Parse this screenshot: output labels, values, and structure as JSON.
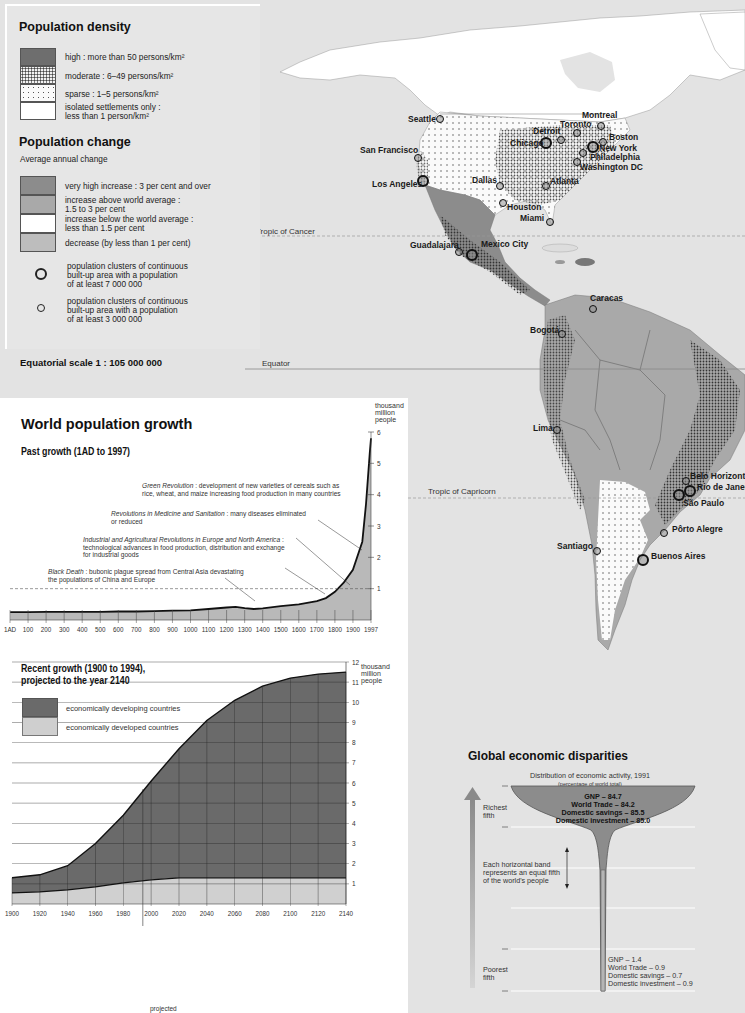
{
  "legend": {
    "density_title": "Population density",
    "density_items": [
      {
        "label_line1": "high : more than 50 persons/km²",
        "label_line2": "",
        "pattern": "dark-solid",
        "color": "#6e6e6e"
      },
      {
        "label_line1": "moderate : 6–49 persons/km²",
        "label_line2": "",
        "pattern": "dense-dots"
      },
      {
        "label_line1": "sparse : 1–5 persons/km²",
        "label_line2": "",
        "pattern": "sparse-dots"
      },
      {
        "label_line1": "isolated settlements only :",
        "label_line2": "less than 1 person/km²",
        "pattern": "white",
        "color": "#ffffff"
      }
    ],
    "change_title": "Population change",
    "change_subtitle": "Average annual change",
    "change_items": [
      {
        "label_line1": "very high increase : 3 per cent and over",
        "label_line2": "",
        "color": "#8c8c8c"
      },
      {
        "label_line1": "increase above world average :",
        "label_line2": "1.5 to 3 per cent",
        "color": "#a9a9a9"
      },
      {
        "label_line1": "increase below the world average :",
        "label_line2": "less than 1.5 per cent",
        "color": "#ffffff"
      },
      {
        "label_line1": "decrease (by less than 1 per cent)",
        "label_line2": "",
        "color": "#bdbdbd"
      }
    ],
    "cluster_items": [
      {
        "symbol": "large-circle",
        "line1": "population clusters of continuous",
        "line2": "built-up area with a population",
        "line3": "of at least 7 000 000"
      },
      {
        "symbol": "small-circle",
        "line1": "population clusters of continuous",
        "line2": "built-up area with a population",
        "line3": "of at least 3 000 000"
      }
    ],
    "scale": "Equatorial scale 1 : 105 000 000"
  },
  "map": {
    "lines": {
      "tropic_cancer": "Tropic of Cancer",
      "equator": "Equator",
      "tropic_capricorn": "Tropic of Capricorn"
    },
    "cities": [
      {
        "name": "Seattle",
        "x": 440,
        "y": 119,
        "size": "small",
        "lx": 408,
        "ly": 119
      },
      {
        "name": "San Francisco",
        "x": 418,
        "y": 158,
        "size": "small",
        "lx": 360,
        "ly": 150
      },
      {
        "name": "Los Angeles",
        "x": 423,
        "y": 181,
        "size": "large",
        "lx": 372,
        "ly": 184
      },
      {
        "name": "Montreal",
        "x": 601,
        "y": 126,
        "size": "small",
        "lx": 582,
        "ly": 115
      },
      {
        "name": "Toronto",
        "x": 577,
        "y": 133,
        "size": "small",
        "lx": 560,
        "ly": 124
      },
      {
        "name": "Detroit",
        "x": 561,
        "y": 140,
        "size": "small",
        "lx": 533,
        "ly": 131
      },
      {
        "name": "Chicago",
        "x": 546,
        "y": 143,
        "size": "large",
        "lx": 510,
        "ly": 143
      },
      {
        "name": "Boston",
        "x": 603,
        "y": 142,
        "size": "small",
        "lx": 609,
        "ly": 137
      },
      {
        "name": "New York",
        "x": 593,
        "y": 147,
        "size": "large",
        "lx": 599,
        "ly": 148
      },
      {
        "name": "Philadelphia",
        "x": 583,
        "y": 153,
        "size": "small",
        "lx": 590,
        "ly": 157
      },
      {
        "name": "Washington DC",
        "x": 577,
        "y": 162,
        "size": "small",
        "lx": 580,
        "ly": 167
      },
      {
        "name": "Dallas",
        "x": 500,
        "y": 186,
        "size": "small",
        "lx": 472,
        "ly": 180
      },
      {
        "name": "Atlanta",
        "x": 546,
        "y": 186,
        "size": "small",
        "lx": 550,
        "ly": 181
      },
      {
        "name": "Houston",
        "x": 503,
        "y": 203,
        "size": "small",
        "lx": 507,
        "ly": 207
      },
      {
        "name": "Miami",
        "x": 550,
        "y": 222,
        "size": "small",
        "lx": 520,
        "ly": 218
      },
      {
        "name": "Guadalajara",
        "x": 459,
        "y": 252,
        "size": "small",
        "lx": 410,
        "ly": 245
      },
      {
        "name": "Mexico City",
        "x": 472,
        "y": 255,
        "size": "large",
        "lx": 481,
        "ly": 244
      },
      {
        "name": "Caracas",
        "x": 593,
        "y": 309,
        "size": "small",
        "lx": 590,
        "ly": 298
      },
      {
        "name": "Bogotá",
        "x": 562,
        "y": 334,
        "size": "small",
        "lx": 530,
        "ly": 330
      },
      {
        "name": "Lima",
        "x": 557,
        "y": 430,
        "size": "small",
        "lx": 533,
        "ly": 428
      },
      {
        "name": "Belo Horizonte",
        "x": 686,
        "y": 481,
        "size": "small",
        "lx": 690,
        "ly": 476
      },
      {
        "name": "Rio de Janeiro",
        "x": 690,
        "y": 491,
        "size": "large",
        "lx": 697,
        "ly": 487
      },
      {
        "name": "São Paulo",
        "x": 679,
        "y": 495,
        "size": "large",
        "lx": 683,
        "ly": 503
      },
      {
        "name": "Pôrto Alegre",
        "x": 664,
        "y": 533,
        "size": "small",
        "lx": 672,
        "ly": 529
      },
      {
        "name": "Santiago",
        "x": 597,
        "y": 551,
        "size": "small",
        "lx": 557,
        "ly": 546
      },
      {
        "name": "Buenos Aires",
        "x": 643,
        "y": 560,
        "size": "large",
        "lx": 651,
        "ly": 556
      }
    ]
  },
  "growth": {
    "title": "World population growth",
    "past": {
      "subtitle": "Past growth (1AD to 1997)",
      "yunit_1": "thousand",
      "yunit_2": "million",
      "yunit_3": "people",
      "annotations": [
        {
          "italic": "Green Revolution",
          "text": " : development of new varieties of cereals such as",
          "line2": "rice, wheat, and maize increasing food production in many countries"
        },
        {
          "italic": "Revolutions in Medicine and Sanitation",
          "text": " : many diseases eliminated",
          "line2": "or reduced"
        },
        {
          "italic": "Industrial and Agricultural Revolutions in Europe and North America",
          "text": " :",
          "line2": "technological advances in food production, distribution and exchange",
          "line3": "for industrial goods"
        },
        {
          "italic": "Black Death",
          "text": " : bubonic plague spread from Central Asia devastating",
          "line2": "the populations of China and Europe"
        }
      ]
    },
    "recent": {
      "subtitle_1": "Recent growth (1900 to 1994),",
      "subtitle_2": "projected to the year 2140",
      "legend": [
        "economically developing countries",
        "economically developed countries"
      ],
      "yunit_1": "thousand",
      "yunit_2": "million",
      "yunit_3": "people",
      "projected_label": "projected"
    }
  },
  "econ": {
    "title": "Global economic disparities",
    "subtitle": "Distribution of economic activity, 1991",
    "subtitle_note": "(percentage of world total)",
    "richest_label_1": "Richest",
    "richest_label_2": "fifth",
    "poorest_label_1": "Poorest",
    "poorest_label_2": "fifth",
    "band_note_1": "Each horizontal band",
    "band_note_2": "represents an equal fifth",
    "band_note_3": "of the world's people",
    "richest_values": [
      "GNP – 84.7",
      "World Trade – 84.2",
      "Domestic savings – 85.5",
      "Domestic investment – 85.0"
    ],
    "poorest_values": [
      "GNP – 1.4",
      "World Trade – 0.9",
      "Domestic savings – 0.7",
      "Domestic investment – 0.9"
    ]
  },
  "chart_data": [
    {
      "type": "area",
      "title": "Past growth (1AD to 1997)",
      "xlabel": "",
      "ylabel": "thousand million people",
      "x": [
        1,
        100,
        200,
        300,
        400,
        500,
        600,
        700,
        800,
        900,
        1000,
        1100,
        1200,
        1250,
        1300,
        1350,
        1400,
        1500,
        1600,
        1700,
        1750,
        1800,
        1850,
        1900,
        1950,
        1970,
        1990,
        1997
      ],
      "values": [
        0.25,
        0.25,
        0.26,
        0.26,
        0.26,
        0.26,
        0.27,
        0.27,
        0.28,
        0.3,
        0.31,
        0.35,
        0.4,
        0.42,
        0.38,
        0.35,
        0.37,
        0.44,
        0.5,
        0.6,
        0.7,
        0.9,
        1.2,
        1.6,
        2.5,
        3.7,
        5.3,
        5.8
      ],
      "xticks": [
        "1AD",
        "100",
        "200",
        "300",
        "400",
        "500",
        "600",
        "700",
        "800",
        "900",
        "1000",
        "1100",
        "1200",
        "1300",
        "1400",
        "1500",
        "1600",
        "1700",
        "1800",
        "1900",
        "1997"
      ],
      "yticks": [
        1,
        2,
        3,
        4,
        5,
        6
      ],
      "ylim": [
        0,
        6
      ],
      "reference_line": 1,
      "grid": false
    },
    {
      "type": "area",
      "title": "Recent growth (1900 to 1994), projected to the year 2140",
      "xlabel": "",
      "ylabel": "thousand million people",
      "x": [
        1900,
        1920,
        1940,
        1960,
        1980,
        2000,
        2020,
        2040,
        2060,
        2080,
        2100,
        2120,
        2140
      ],
      "series": [
        {
          "name": "economically developed countries",
          "values": [
            0.55,
            0.6,
            0.7,
            0.85,
            1.05,
            1.2,
            1.3,
            1.3,
            1.3,
            1.3,
            1.3,
            1.3,
            1.3
          ]
        },
        {
          "name": "economically developing countries",
          "values": [
            0.75,
            0.85,
            1.2,
            2.15,
            3.35,
            4.9,
            6.4,
            7.8,
            8.8,
            9.5,
            9.9,
            10.1,
            10.2
          ]
        }
      ],
      "totals": [
        1.3,
        1.45,
        1.9,
        3.0,
        4.4,
        6.1,
        7.7,
        9.1,
        10.1,
        10.8,
        11.2,
        11.4,
        11.5
      ],
      "xticks": [
        "1900",
        "1920",
        "1940",
        "1960",
        "1980",
        "2000",
        "2020",
        "2040",
        "2060",
        "2080",
        "2100",
        "2120",
        "2140"
      ],
      "yticks": [
        1,
        2,
        3,
        4,
        5,
        6,
        7,
        8,
        9,
        10,
        11,
        12
      ],
      "ylim": [
        0,
        12
      ],
      "projected_from": 1994,
      "grid": true,
      "legend_position": "top-left"
    },
    {
      "type": "bar",
      "title": "Global economic disparities — Distribution of economic activity, 1991 (percentage of world total)",
      "categories": [
        "Richest fifth",
        "Second fifth",
        "Third fifth",
        "Fourth fifth",
        "Poorest fifth"
      ],
      "series": [
        {
          "name": "GNP",
          "values": [
            84.7,
            null,
            null,
            null,
            1.4
          ]
        },
        {
          "name": "World Trade",
          "values": [
            84.2,
            null,
            null,
            null,
            0.9
          ]
        },
        {
          "name": "Domestic savings",
          "values": [
            85.5,
            null,
            null,
            null,
            0.7
          ]
        },
        {
          "name": "Domestic investment",
          "values": [
            85.0,
            null,
            null,
            null,
            0.9
          ]
        }
      ]
    }
  ]
}
